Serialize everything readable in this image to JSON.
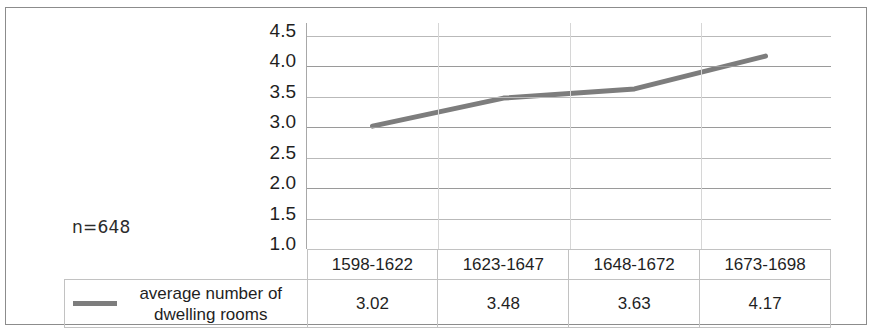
{
  "annotation": {
    "sample_size": "n=648"
  },
  "legend": {
    "series_label": "average number of dwelling rooms",
    "swatch_color": "#7d7d7d"
  },
  "axis": {
    "y_ticks": [
      "4.5",
      "4.0",
      "3.5",
      "3.0",
      "2.5",
      "2.0",
      "1.5",
      "1.0"
    ]
  },
  "table": {
    "periods": [
      "1598-1622",
      "1623-1647",
      "1648-1672",
      "1673-1698"
    ],
    "values": [
      "3.02",
      "3.48",
      "3.63",
      "4.17"
    ]
  },
  "chart_data": {
    "type": "line",
    "title": "",
    "xlabel": "",
    "ylabel": "",
    "categories": [
      "1598-1622",
      "1623-1647",
      "1648-1672",
      "1673-1698"
    ],
    "series": [
      {
        "name": "average number of dwelling rooms",
        "values": [
          3.02,
          3.48,
          3.63,
          4.17
        ],
        "color": "#7d7d7d",
        "line_width": 5
      }
    ],
    "ylim": [
      1.0,
      4.5
    ],
    "y_ticks": [
      1.0,
      1.5,
      2.0,
      2.5,
      3.0,
      3.5,
      4.0,
      4.5
    ],
    "grid": true,
    "grid_axis": "y",
    "legend_position": "table-left",
    "annotations": [
      "n=648"
    ],
    "data_table_shown": true
  }
}
